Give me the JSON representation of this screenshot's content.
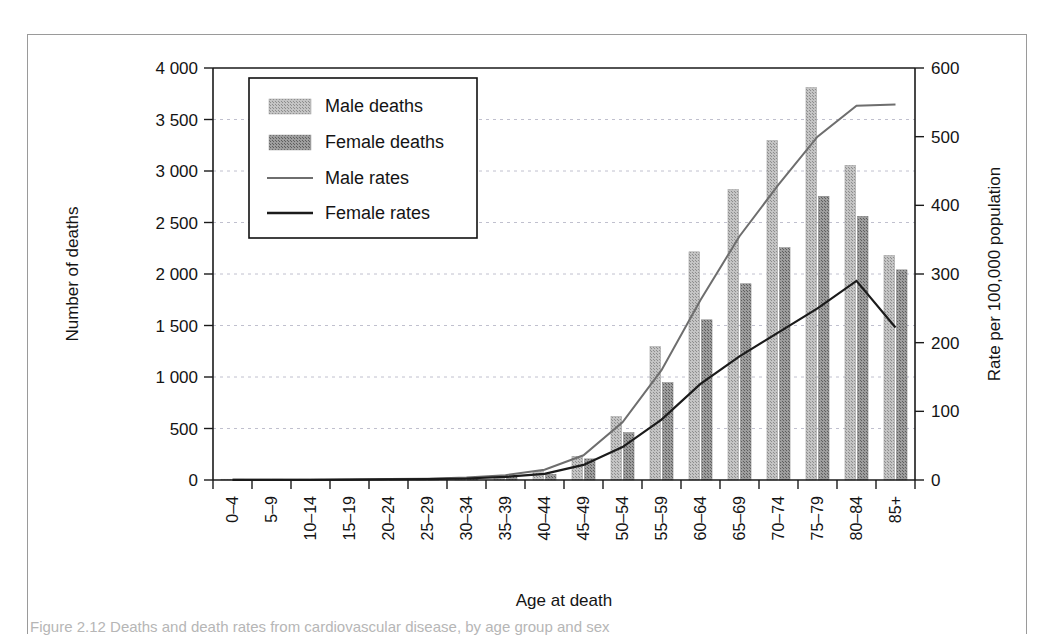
{
  "figure": {
    "caption_partial": "Figure 2.12   Deaths and death rates from cardiovascular disease, by age group and sex"
  },
  "chart_data": {
    "type": "bar",
    "title": "",
    "xlabel": "Age at death",
    "ylabel": "Number of deaths",
    "y2label": "Rate per 100,000 population",
    "ylim": [
      0,
      4000
    ],
    "y2lim": [
      0,
      600
    ],
    "ytick_labels": [
      "0",
      "500",
      "1 000",
      "1 500",
      "2 000",
      "2 500",
      "3 000",
      "3 500",
      "4 000"
    ],
    "ytick_values": [
      0,
      500,
      1000,
      1500,
      2000,
      2500,
      3000,
      3500,
      4000
    ],
    "y2tick_labels": [
      "0",
      "100",
      "200",
      "300",
      "400",
      "500",
      "600"
    ],
    "y2tick_values": [
      0,
      100,
      200,
      300,
      400,
      500,
      600
    ],
    "grid": true,
    "legend_position": "upper-left-inside",
    "categories": [
      "0–4",
      "5–9",
      "10–14",
      "15–19",
      "20–24",
      "25–29",
      "30–34",
      "35–39",
      "40–44",
      "45–49",
      "50–54",
      "55–59",
      "60–64",
      "65–69",
      "70–74",
      "75–79",
      "80–84",
      "85+"
    ],
    "series": [
      {
        "name": "Male deaths",
        "kind": "bar",
        "axis": "left",
        "color": "#b0b0b0",
        "values": [
          2,
          2,
          3,
          6,
          10,
          14,
          22,
          40,
          85,
          230,
          615,
          1295,
          2215,
          2820,
          3295,
          3810,
          3055,
          2180
        ]
      },
      {
        "name": "Female deaths",
        "kind": "bar",
        "axis": "left",
        "color": "#8a8a8a",
        "values": [
          2,
          2,
          2,
          4,
          7,
          10,
          16,
          30,
          55,
          205,
          460,
          945,
          1555,
          1905,
          2255,
          2755,
          2560,
          2040
        ]
      },
      {
        "name": "Male rates",
        "kind": "line",
        "axis": "right",
        "color": "#6e6e6e",
        "values": [
          0.3,
          0.3,
          0.4,
          0.8,
          1.3,
          2,
          3.5,
          7,
          15,
          36,
          84,
          160,
          262,
          355,
          430,
          500,
          545,
          547
        ]
      },
      {
        "name": "Female rates",
        "kind": "line",
        "axis": "right",
        "color": "#1b1b1b",
        "values": [
          0.3,
          0.3,
          0.3,
          0.5,
          0.9,
          1.3,
          2.2,
          4.5,
          9,
          22,
          48,
          88,
          140,
          180,
          215,
          250,
          290,
          222
        ]
      }
    ]
  }
}
